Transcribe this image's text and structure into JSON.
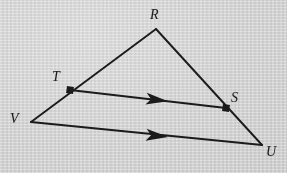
{
  "figure": {
    "background_color": "#d7d7d7",
    "stroke_color": "#1b1b1b",
    "labels": {
      "apex": "R",
      "left_point": "T",
      "right_point": "S",
      "left_vertex": "V",
      "right_vertex": "U"
    },
    "points": {
      "R": {
        "x": 156,
        "y": 29
      },
      "T": {
        "x": 70,
        "y": 90
      },
      "S": {
        "x": 226,
        "y": 108
      },
      "V": {
        "x": 31,
        "y": 122
      },
      "U": {
        "x": 262,
        "y": 145
      }
    },
    "label_positions": {
      "R": {
        "x": 150,
        "y": 8
      },
      "T": {
        "x": 52,
        "y": 70
      },
      "S": {
        "x": 231,
        "y": 91
      },
      "V": {
        "x": 10,
        "y": 112
      },
      "U": {
        "x": 266,
        "y": 145
      }
    },
    "marked_points": [
      "T",
      "S"
    ],
    "segments": [
      {
        "name": "RV",
        "from": "R",
        "to": "V",
        "arrow": false
      },
      {
        "name": "RU",
        "from": "R",
        "to": "U",
        "arrow": false
      },
      {
        "name": "TS",
        "from": "T",
        "to": "S",
        "arrow": true
      },
      {
        "name": "VU",
        "from": "V",
        "to": "U",
        "arrow": true
      }
    ],
    "arrow_marks": [
      {
        "name": "ts-parallel-arrow",
        "x": 158,
        "y": 100,
        "angle": 6.6
      },
      {
        "name": "vu-parallel-arrow",
        "x": 158,
        "y": 136,
        "angle": 5.7
      }
    ]
  }
}
